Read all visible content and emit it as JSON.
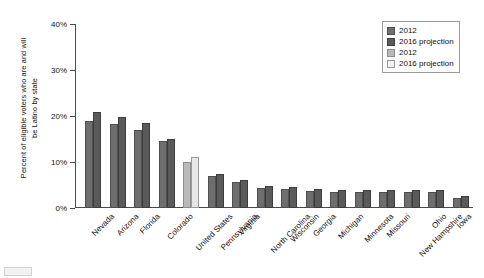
{
  "chart_data": {
    "type": "bar",
    "title": "",
    "xlabel": "",
    "ylabel": "Percent of eligible voters who are and will be Latino by state",
    "ylabel_lines": [
      "Percent of eligible voters who are and will",
      "be Latino by state"
    ],
    "ylim": [
      0,
      40
    ],
    "yticks": [
      0,
      10,
      20,
      30,
      40
    ],
    "ytick_labels": [
      "0%",
      "10%",
      "20%",
      "30%",
      "40%"
    ],
    "grid": false,
    "legend_position": "top-right",
    "legend": [
      {
        "label": "2012",
        "swatch": "d1"
      },
      {
        "label": "2016 projection",
        "swatch": "d2"
      },
      {
        "label": "2012",
        "swatch": "l1"
      },
      {
        "label": "2016 projection",
        "swatch": "l2"
      }
    ],
    "categories": [
      "Nevada",
      "Arizona",
      "Florida",
      "Colorado",
      "United States",
      "Pennsylvania",
      "Virginia",
      "North Carolina",
      "Wisconsin",
      "Georgia",
      "Michigan",
      "Minnesota",
      "Missouri",
      "New Hampshire",
      "Ohio",
      "Iowa"
    ],
    "highlight_category": "United States",
    "series": [
      {
        "name": "2012",
        "values": [
          19.0,
          18.3,
          17.0,
          14.5,
          10.1,
          6.9,
          5.6,
          4.3,
          4.2,
          3.6,
          3.5,
          3.4,
          3.4,
          3.5,
          3.5,
          2.1
        ]
      },
      {
        "name": "2016 projection",
        "values": [
          20.8,
          19.7,
          18.4,
          14.9,
          11.1,
          7.4,
          6.0,
          4.7,
          4.6,
          4.1,
          3.9,
          3.9,
          3.9,
          4.0,
          3.9,
          2.6
        ]
      }
    ],
    "colors": {
      "bar_2012_dark": "#6e6e6e",
      "bar_2016_dark": "#5a5a5a",
      "bar_2012_light": "#b9b9b9",
      "bar_2016_light": "#e6e6e6",
      "axis": "#4a4a4a",
      "text": "#111111",
      "background": "#ffffff"
    }
  }
}
